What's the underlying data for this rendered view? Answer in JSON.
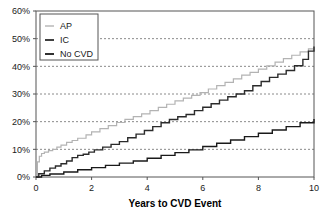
{
  "chart_data": {
    "type": "line",
    "title": "",
    "subtitle": "",
    "xlabel": "Years to CVD Event",
    "ylabel": "",
    "xlim": [
      0,
      10
    ],
    "ylim": [
      0,
      0.6
    ],
    "xticks": [
      0,
      2,
      4,
      6,
      8,
      10
    ],
    "xtick_labels": [
      "0",
      "2",
      "4",
      "6",
      "8",
      "10"
    ],
    "yticks": [
      0,
      0.1,
      0.2,
      0.3,
      0.4,
      0.5,
      0.6
    ],
    "ytick_labels": [
      "0%",
      "10%",
      "20%",
      "30%",
      "40%",
      "50%",
      "60%"
    ],
    "grid": "horizontal-dashed",
    "legend_position": "top-left",
    "step_style": "post",
    "series": [
      {
        "name": "AP",
        "color": "#b3b3b3",
        "x": [
          0,
          0.05,
          0.12,
          0.2,
          0.3,
          0.45,
          0.6,
          0.75,
          0.9,
          1.1,
          1.3,
          1.5,
          1.8,
          2.0,
          2.3,
          2.6,
          2.9,
          3.2,
          3.5,
          3.8,
          4.1,
          4.4,
          4.7,
          5.0,
          5.3,
          5.6,
          5.9,
          6.2,
          6.5,
          6.8,
          7.1,
          7.4,
          7.7,
          8.0,
          8.3,
          8.6,
          8.9,
          9.2,
          9.5,
          9.8,
          10.0
        ],
        "y": [
          0.0,
          0.055,
          0.075,
          0.085,
          0.09,
          0.095,
          0.1,
          0.108,
          0.115,
          0.125,
          0.132,
          0.14,
          0.152,
          0.163,
          0.175,
          0.186,
          0.197,
          0.208,
          0.218,
          0.228,
          0.24,
          0.252,
          0.263,
          0.275,
          0.285,
          0.295,
          0.305,
          0.318,
          0.33,
          0.342,
          0.355,
          0.368,
          0.378,
          0.39,
          0.402,
          0.415,
          0.428,
          0.44,
          0.452,
          0.463,
          0.47
        ]
      },
      {
        "name": "IC",
        "color": "#2b2b2b",
        "x": [
          0,
          0.1,
          0.3,
          0.5,
          0.7,
          0.9,
          1.1,
          1.3,
          1.5,
          1.7,
          1.9,
          2.1,
          2.4,
          2.7,
          3.0,
          3.3,
          3.6,
          3.9,
          4.2,
          4.5,
          4.8,
          5.1,
          5.4,
          5.7,
          6.0,
          6.3,
          6.6,
          6.9,
          7.2,
          7.5,
          7.8,
          8.1,
          8.4,
          8.7,
          9.0,
          9.3,
          9.6,
          9.8,
          10.0
        ],
        "y": [
          0.0,
          0.012,
          0.022,
          0.032,
          0.04,
          0.048,
          0.058,
          0.07,
          0.078,
          0.082,
          0.09,
          0.098,
          0.108,
          0.118,
          0.128,
          0.142,
          0.155,
          0.168,
          0.182,
          0.196,
          0.208,
          0.218,
          0.226,
          0.24,
          0.252,
          0.265,
          0.278,
          0.29,
          0.3,
          0.312,
          0.33,
          0.345,
          0.36,
          0.372,
          0.385,
          0.402,
          0.425,
          0.455,
          0.472
        ]
      },
      {
        "name": "No CVD",
        "color": "#1a1a1a",
        "x": [
          0,
          0.2,
          0.5,
          1.0,
          1.5,
          2.0,
          2.5,
          3.0,
          3.5,
          4.0,
          4.5,
          5.0,
          5.5,
          6.0,
          6.5,
          7.0,
          7.5,
          8.0,
          8.5,
          9.0,
          9.5,
          10.0
        ],
        "y": [
          0.0,
          0.006,
          0.011,
          0.018,
          0.026,
          0.034,
          0.042,
          0.05,
          0.058,
          0.068,
          0.078,
          0.088,
          0.098,
          0.11,
          0.122,
          0.134,
          0.146,
          0.158,
          0.17,
          0.182,
          0.196,
          0.21
        ]
      }
    ]
  },
  "legend": {
    "items": [
      {
        "label": "AP"
      },
      {
        "label": "IC"
      },
      {
        "label": "No CVD"
      }
    ]
  }
}
